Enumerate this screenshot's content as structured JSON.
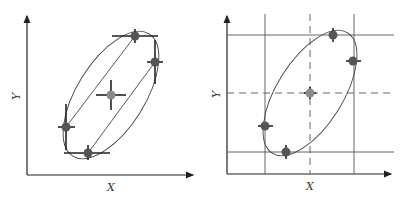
{
  "panels": [
    {
      "id": "left",
      "x_label": "X",
      "y_label": "Y",
      "points": [
        {
          "role": "top",
          "x": 135,
          "y": 36
        },
        {
          "role": "right",
          "x": 155,
          "y": 62
        },
        {
          "role": "center",
          "x": 111,
          "y": 95
        },
        {
          "role": "left",
          "x": 66,
          "y": 127
        },
        {
          "role": "bottom",
          "x": 88,
          "y": 153
        }
      ]
    },
    {
      "id": "right",
      "x_label": "X",
      "y_label": "Y",
      "points": [
        {
          "role": "top",
          "x": 333,
          "y": 35
        },
        {
          "role": "right",
          "x": 353,
          "y": 61
        },
        {
          "role": "center",
          "x": 310,
          "y": 93
        },
        {
          "role": "left",
          "x": 265,
          "y": 126
        },
        {
          "role": "bottom",
          "x": 286,
          "y": 152
        }
      ]
    }
  ],
  "colors": {
    "stroke": "#333333",
    "grid": "#555555",
    "point": "#555555",
    "center_point": "#8a8a8a"
  }
}
